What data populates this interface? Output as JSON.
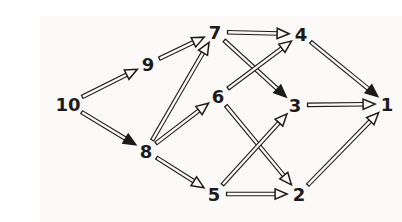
{
  "figure": {
    "type": "directed-graph",
    "background_color": "#fbfaf8",
    "ink_color": "#1b1b1b",
    "arrow_fill_color": "#fbfaf8"
  },
  "graph": {
    "nodes": [
      {
        "id": "10",
        "label": "10",
        "x": 28,
        "y": 88
      },
      {
        "id": "9",
        "label": "9",
        "x": 108,
        "y": 48
      },
      {
        "id": "8",
        "label": "8",
        "x": 106,
        "y": 135
      },
      {
        "id": "7",
        "label": "7",
        "x": 175,
        "y": 16
      },
      {
        "id": "6",
        "label": "6",
        "x": 178,
        "y": 80
      },
      {
        "id": "5",
        "label": "5",
        "x": 174,
        "y": 178
      },
      {
        "id": "4",
        "label": "4",
        "x": 261,
        "y": 18
      },
      {
        "id": "3",
        "label": "3",
        "x": 255,
        "y": 89
      },
      {
        "id": "2",
        "label": "2",
        "x": 259,
        "y": 178
      },
      {
        "id": "1",
        "label": "1",
        "x": 347,
        "y": 88
      }
    ],
    "edges": [
      {
        "from": "10",
        "to": "9",
        "head": "open"
      },
      {
        "from": "10",
        "to": "8",
        "head": "filled"
      },
      {
        "from": "9",
        "to": "7",
        "head": "open"
      },
      {
        "from": "8",
        "to": "7",
        "head": "open"
      },
      {
        "from": "8",
        "to": "6",
        "head": "open"
      },
      {
        "from": "8",
        "to": "5",
        "head": "open"
      },
      {
        "from": "7",
        "to": "4",
        "head": "open"
      },
      {
        "from": "7",
        "to": "3",
        "head": "filled"
      },
      {
        "from": "6",
        "to": "4",
        "head": "open"
      },
      {
        "from": "6",
        "to": "2",
        "head": "open"
      },
      {
        "from": "5",
        "to": "3",
        "head": "open"
      },
      {
        "from": "5",
        "to": "2",
        "head": "open"
      },
      {
        "from": "4",
        "to": "1",
        "head": "filled"
      },
      {
        "from": "3",
        "to": "1",
        "head": "open"
      },
      {
        "from": "2",
        "to": "1",
        "head": "open"
      }
    ]
  }
}
